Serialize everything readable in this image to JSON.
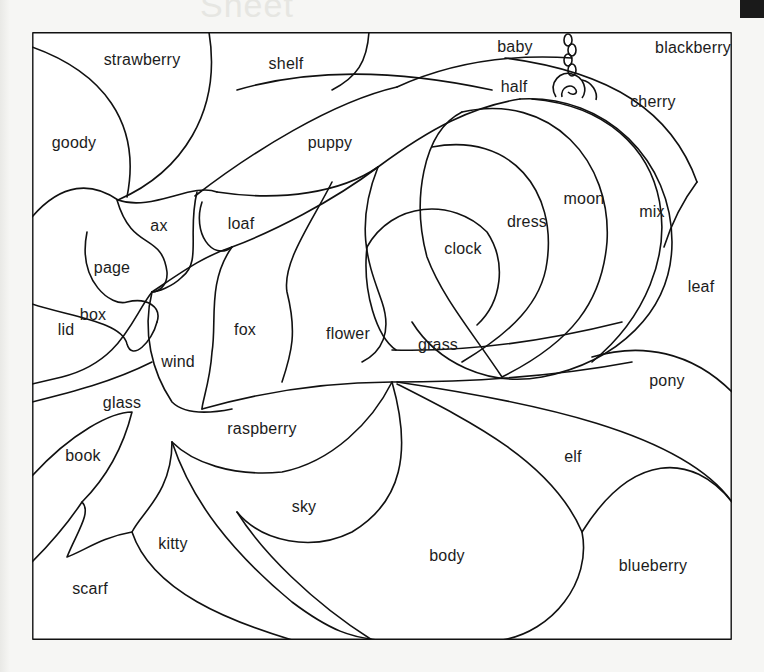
{
  "worksheet": {
    "header_faint_text": "Sheet",
    "accent_colors": {
      "line": "#111111",
      "paper": "#ffffff",
      "background": "#f6f6f4"
    },
    "regions": [
      {
        "id": "strawberry",
        "label": "strawberry"
      },
      {
        "id": "shelf",
        "label": "shelf"
      },
      {
        "id": "baby",
        "label": "baby"
      },
      {
        "id": "blackberry",
        "label": "blackberry"
      },
      {
        "id": "half",
        "label": "half"
      },
      {
        "id": "cherry",
        "label": "cherry"
      },
      {
        "id": "goody",
        "label": "goody"
      },
      {
        "id": "puppy",
        "label": "puppy"
      },
      {
        "id": "moon",
        "label": "moon"
      },
      {
        "id": "mix",
        "label": "mix"
      },
      {
        "id": "dress",
        "label": "dress"
      },
      {
        "id": "ax",
        "label": "ax"
      },
      {
        "id": "loaf",
        "label": "loaf"
      },
      {
        "id": "clock",
        "label": "clock"
      },
      {
        "id": "page",
        "label": "page"
      },
      {
        "id": "leaf",
        "label": "leaf"
      },
      {
        "id": "box",
        "label": "box"
      },
      {
        "id": "fox",
        "label": "fox"
      },
      {
        "id": "flower",
        "label": "flower"
      },
      {
        "id": "grass",
        "label": "grass"
      },
      {
        "id": "lid",
        "label": "lid"
      },
      {
        "id": "wind",
        "label": "wind"
      },
      {
        "id": "pony",
        "label": "pony"
      },
      {
        "id": "glass",
        "label": "glass"
      },
      {
        "id": "raspberry",
        "label": "raspberry"
      },
      {
        "id": "book",
        "label": "book"
      },
      {
        "id": "elf",
        "label": "elf"
      },
      {
        "id": "sky",
        "label": "sky"
      },
      {
        "id": "kitty",
        "label": "kitty"
      },
      {
        "id": "body",
        "label": "body"
      },
      {
        "id": "blueberry",
        "label": "blueberry"
      },
      {
        "id": "scarf",
        "label": "scarf"
      }
    ]
  }
}
